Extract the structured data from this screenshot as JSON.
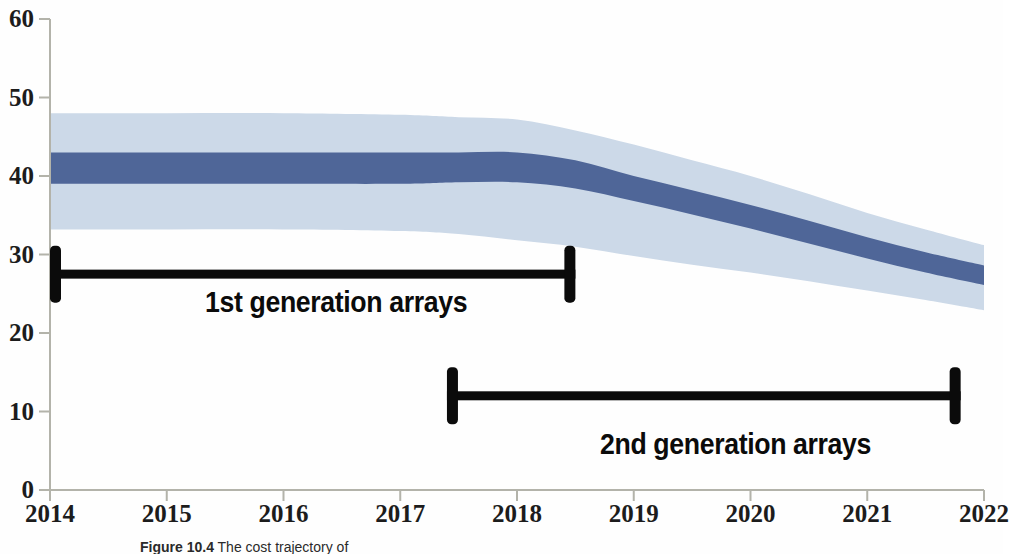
{
  "figure": {
    "caption_bold": "Figure 10.4",
    "caption_rest": " The cost trajectory of"
  },
  "axes": {
    "y_ticks": [
      "0",
      "10",
      "20",
      "30",
      "40",
      "50",
      "60"
    ],
    "x_ticks": [
      "2014",
      "2015",
      "2016",
      "2017",
      "2018",
      "2019",
      "2020",
      "2021",
      "2022"
    ],
    "axis_color": "#b3b3aa"
  },
  "annotations": [
    {
      "label": "1st generation arrays",
      "start_year": 2014.0,
      "end_year": 2018.5,
      "level": 27.5
    },
    {
      "label": "2nd generation arrays",
      "start_year": 2017.4,
      "end_year": 2021.8,
      "level": 12.0
    }
  ],
  "colors": {
    "outer_band": "#ccd9e8",
    "inner_band": "#4f6698",
    "annotation": "#0b0b0b",
    "text": "#1c1c1c"
  },
  "chart_data": {
    "type": "area",
    "title": "",
    "xlabel": "",
    "ylabel": "",
    "xlim": [
      2014,
      2022
    ],
    "ylim": [
      0,
      60
    ],
    "grid": false,
    "legend": "none",
    "x": [
      2014,
      2015,
      2016,
      2017,
      2017.5,
      2018,
      2018.5,
      2019,
      2019.5,
      2020,
      2020.5,
      2021,
      2021.5,
      2022
    ],
    "series": [
      {
        "name": "outer band upper",
        "values": [
          48.0,
          48.0,
          48.0,
          47.8,
          47.5,
          47.2,
          45.8,
          44.0,
          42.0,
          40.0,
          37.7,
          35.3,
          33.2,
          31.2
        ]
      },
      {
        "name": "inner band upper",
        "values": [
          43.0,
          43.0,
          43.0,
          43.0,
          43.0,
          43.0,
          42.0,
          40.0,
          38.2,
          36.3,
          34.3,
          32.2,
          30.3,
          28.6
        ]
      },
      {
        "name": "inner band lower",
        "values": [
          39.0,
          39.0,
          39.0,
          39.0,
          39.2,
          39.2,
          38.4,
          36.8,
          35.1,
          33.3,
          31.4,
          29.5,
          27.7,
          26.1
        ]
      },
      {
        "name": "outer band lower",
        "values": [
          33.2,
          33.2,
          33.2,
          33.0,
          32.6,
          31.8,
          31.0,
          29.8,
          28.7,
          27.7,
          26.6,
          25.4,
          24.2,
          22.9
        ]
      }
    ]
  }
}
